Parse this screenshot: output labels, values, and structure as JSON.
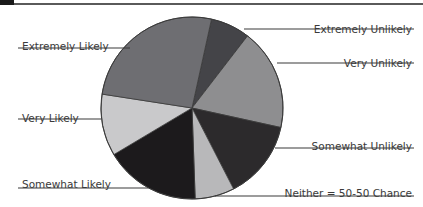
{
  "chart_data": {
    "type": "pie",
    "title": "",
    "start_angle_deg": 12.4,
    "direction": "clockwise",
    "center": [
      192,
      108
    ],
    "radius": 91,
    "slices": [
      {
        "label": "Extremely Unlikely",
        "value": 7,
        "color": "#444448",
        "label_side": "right",
        "label_x": 412,
        "label_y": 27,
        "line_y": 29,
        "line_x1": 244,
        "line_x2": 414
      },
      {
        "label": "Very Unlikely",
        "value": 18,
        "color": "#8e8e90",
        "label_side": "right",
        "label_x": 412,
        "label_y": 61,
        "line_y": 63,
        "line_x1": 277,
        "line_x2": 414
      },
      {
        "label": "Somewhat Unlikely",
        "value": 14,
        "color": "#2c2a2c",
        "label_side": "right",
        "label_x": 412,
        "label_y": 144,
        "line_y": 148,
        "line_x1": 275,
        "line_x2": 414
      },
      {
        "label": "Neither = 50-50 Chance",
        "value": 7,
        "color": "#b8b8ba",
        "label_side": "right",
        "label_x": 412,
        "label_y": 191,
        "line_y": 196,
        "line_x1": 215,
        "line_x2": 414
      },
      {
        "label": "Somewhat Likely",
        "value": 17,
        "color": "#1c1a1c",
        "label_side": "left",
        "label_x": 22,
        "label_y": 182,
        "line_y": 188,
        "line_x1": 18,
        "line_x2": 148
      },
      {
        "label": "Very Likely",
        "value": 11,
        "color": "#c9c9cb",
        "label_side": "left",
        "label_x": 22,
        "label_y": 116,
        "line_y": 119,
        "line_x1": 18,
        "line_x2": 101
      },
      {
        "label": "Extremely Likely",
        "value": 26,
        "color": "#6e6e72",
        "label_side": "left",
        "label_x": 22,
        "label_y": 44,
        "line_y": 48,
        "line_x1": 18,
        "line_x2": 130
      }
    ],
    "legend": "callout labels with leader lines",
    "grid": false
  },
  "colors": {
    "outline": "#3a3a3a",
    "text": "#3a3a3a",
    "leader_line": "#3a3a3a",
    "background": "#ffffff"
  }
}
